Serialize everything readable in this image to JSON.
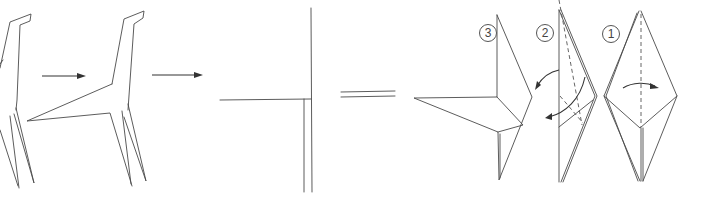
{
  "diagram": {
    "type": "origami-folding-sequence",
    "steps": [
      {
        "label": "1",
        "description": "Valley fold along dashed center line"
      },
      {
        "label": "2",
        "description": "Reverse-fold flaps outward"
      },
      {
        "label": "3",
        "description": "Resulting shape with extended point"
      }
    ],
    "symbols": {
      "process_arrows": 2,
      "equals_sign": "="
    },
    "colors": {
      "line": "#4a4a4a",
      "background": "#ffffff"
    }
  }
}
